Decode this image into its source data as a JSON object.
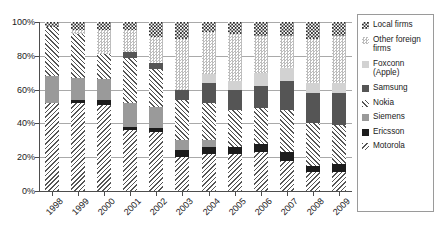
{
  "chart_data": {
    "type": "bar",
    "subtype": "stacked-100-percent",
    "title": "",
    "xlabel": "",
    "ylabel": "",
    "ylim": [
      0,
      100
    ],
    "yticks": [
      0,
      20,
      40,
      60,
      80,
      100
    ],
    "ytick_labels": [
      "0%",
      "20%",
      "40%",
      "60%",
      "80%",
      "100%"
    ],
    "grid": true,
    "legend_position": "right",
    "categories": [
      "1998",
      "1999",
      "2000",
      "2001",
      "2002",
      "2003",
      "2004",
      "2005",
      "2006",
      "2007",
      "2008",
      "2009"
    ],
    "series": [
      {
        "name": "Motorola",
        "key": "motorola",
        "pattern": "diagonal-hatch-down",
        "values": [
          52,
          52,
          51,
          36,
          35,
          20,
          22,
          22,
          23,
          18,
          11,
          11
        ]
      },
      {
        "name": "Ericsson",
        "key": "ericsson",
        "pattern": "solid-black",
        "values": [
          0,
          2,
          3,
          2,
          2,
          4,
          4,
          4,
          5,
          5,
          4,
          5
        ]
      },
      {
        "name": "Siemens",
        "key": "siemens",
        "pattern": "solid-medium-gray",
        "values": [
          16,
          13,
          12,
          14,
          13,
          6,
          4,
          0,
          0,
          0,
          0,
          0
        ]
      },
      {
        "name": "Nokia",
        "key": "nokia",
        "pattern": "diagonal-hatch-up",
        "values": [
          29,
          26,
          15,
          27,
          22,
          24,
          22,
          22,
          21,
          25,
          25,
          23
        ]
      },
      {
        "name": "Samsung",
        "key": "samsung",
        "pattern": "solid-dark-gray",
        "values": [
          0,
          0,
          0,
          3,
          4,
          6,
          12,
          12,
          13,
          17,
          18,
          19
        ]
      },
      {
        "name": "Foxconn (Apple)",
        "key": "foxconn",
        "pattern": "solid-light-gray",
        "values": [
          0,
          0,
          0,
          0,
          0,
          0,
          5,
          5,
          8,
          8,
          6,
          6
        ]
      },
      {
        "name": "Other foreign firms",
        "key": "otherforeign",
        "pattern": "light-checker",
        "values": [
          0,
          2,
          14,
          13,
          15,
          30,
          25,
          28,
          22,
          19,
          26,
          28
        ]
      },
      {
        "name": "Local firms",
        "key": "local",
        "pattern": "dark-checker",
        "values": [
          3,
          5,
          5,
          5,
          9,
          10,
          6,
          7,
          8,
          8,
          10,
          8
        ]
      }
    ]
  },
  "legend": {
    "items": [
      {
        "label": "Local firms",
        "key": "local"
      },
      {
        "label": "Other foreign firms",
        "key": "otherforeign"
      },
      {
        "label": "Foxconn (Apple)",
        "key": "foxconn"
      },
      {
        "label": "Samsung",
        "key": "samsung"
      },
      {
        "label": "Nokia",
        "key": "nokia"
      },
      {
        "label": "Siemens",
        "key": "siemens"
      },
      {
        "label": "Ericsson",
        "key": "ericsson"
      },
      {
        "label": "Motorola",
        "key": "motorola"
      }
    ]
  }
}
